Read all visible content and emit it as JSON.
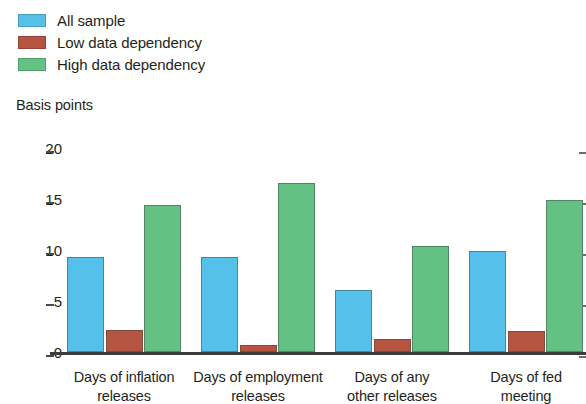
{
  "chart_data": {
    "type": "bar",
    "title": "",
    "subtitle": "",
    "xlabel": "",
    "ylabel": "Basis points",
    "ylim": [
      0,
      20
    ],
    "yticks": [
      0,
      5,
      10,
      15,
      20
    ],
    "ytick_labels": [
      "0",
      "5",
      "10",
      "15",
      "20"
    ],
    "grid": false,
    "legend_position": "top-left",
    "categories": [
      "Days of inflation releases",
      "Days of employment releases",
      "Days of any other releases",
      "Days of fed meeting"
    ],
    "category_lines": [
      [
        "Days of inflation",
        "releases"
      ],
      [
        "Days of employment",
        "releases"
      ],
      [
        "Days of any",
        "other releases"
      ],
      [
        "Days of fed",
        "meeting"
      ]
    ],
    "series": [
      {
        "name": "All sample",
        "color": "#55c0ea",
        "values": [
          9.3,
          9.3,
          6.1,
          9.9
        ]
      },
      {
        "name": "Low data dependency",
        "color": "#b55440",
        "values": [
          2.2,
          0.7,
          1.3,
          2.1
        ]
      },
      {
        "name": "High data dependency",
        "color": "#63c183",
        "values": [
          14.4,
          16.6,
          10.4,
          14.9
        ]
      }
    ]
  },
  "legend": {
    "items": [
      {
        "label": "All sample",
        "color": "#55c0ea"
      },
      {
        "label": "Low data dependency",
        "color": "#b55440"
      },
      {
        "label": "High data dependency",
        "color": "#63c183"
      }
    ]
  },
  "axis": {
    "y_title": "Basis points"
  }
}
